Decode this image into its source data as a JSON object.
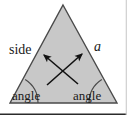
{
  "figure": {
    "canvas": {
      "width": 127,
      "height": 115
    },
    "background_color": "#ffffff",
    "border_color": "#2b2b2b",
    "shape": {
      "name": "triangle",
      "fill_color": "#c8c8c8",
      "stroke_color": "#4a4a4a",
      "apex": [
        63,
        5
      ],
      "bottom_left": [
        10,
        103
      ],
      "bottom_right": [
        117,
        103
      ]
    },
    "labels": {
      "side": "side",
      "a": "a",
      "angle_left": "angle",
      "angle_right": "angle"
    },
    "arcs": {
      "stroke_color": "#4a4a4a",
      "radius": 28
    },
    "arrows": {
      "stroke_color": "#111111",
      "count": 2,
      "left_arrow": {
        "from": [
          78,
          84
        ],
        "to": [
          44,
          55
        ]
      },
      "right_arrow": {
        "from": [
          47,
          85
        ],
        "to": [
          82,
          54
        ]
      }
    }
  }
}
